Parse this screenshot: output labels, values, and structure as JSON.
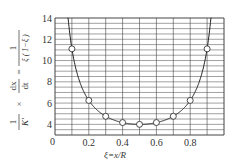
{
  "chart_data": {
    "type": "line",
    "title": "",
    "xlabel": "ξ=x/R",
    "ylabel_parts": {
      "frac1_num": "1",
      "frac1_den": "K'",
      "times": "×",
      "frac2_num": "dx",
      "frac2_den": "dt",
      "eq": "=",
      "frac3_num": "1",
      "frac3_den": "ξ ( 1−ξ )"
    },
    "xlim": [
      0,
      1.0
    ],
    "ylim": [
      3,
      14
    ],
    "grid": true,
    "x_ticks": [
      0.2,
      0.4,
      0.6,
      0.8
    ],
    "x_tick_labels": [
      "0.2",
      "0.4",
      "0.6",
      "0.8"
    ],
    "origin_label": "0",
    "y_ticks": [
      4,
      6,
      8,
      10,
      12,
      14
    ],
    "y_tick_labels": [
      "4",
      "6",
      "8",
      "10",
      "12",
      "14"
    ],
    "series": [
      {
        "name": "1/(ξ(1−ξ))",
        "x": [
          0.1,
          0.2,
          0.3,
          0.4,
          0.5,
          0.6,
          0.7,
          0.8,
          0.9
        ],
        "y": [
          11.1,
          6.25,
          4.76,
          4.17,
          4.0,
          4.17,
          4.76,
          6.25,
          11.1
        ]
      }
    ]
  }
}
